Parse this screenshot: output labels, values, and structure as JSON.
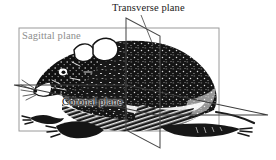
{
  "figure": {
    "background_color": "#ffffff",
    "labels": {
      "transverse": "Transverse plane",
      "sagittal": "Sagittal plane",
      "coronal": "Coronal plane"
    },
    "colors": {
      "transverse_plane_stroke": "#4a4a4a",
      "sagittal_plane_stroke": "#9a9a9a",
      "coronal_plane_stroke": "#3c3c3c",
      "leader_line": "#555555",
      "label_transverse": "#1a1a1a",
      "label_sagittal": "#8e8e8e",
      "label_coronal": "#111111",
      "animal_ink": "#141414"
    },
    "planes": [
      {
        "name": "sagittal",
        "shape": "rectangle",
        "points": "19,28 219,28 219,131 19,131"
      },
      {
        "name": "transverse",
        "shape": "parallelogram",
        "points": "126,18 160,36 160,148 126,130"
      },
      {
        "name": "coronal",
        "shape": "parallelogram",
        "points": "14,85 126,85 268,115 156,115"
      }
    ],
    "leader_lines": [
      {
        "name": "transverse-leader",
        "from": "140,16",
        "to": "152,44"
      }
    ]
  }
}
